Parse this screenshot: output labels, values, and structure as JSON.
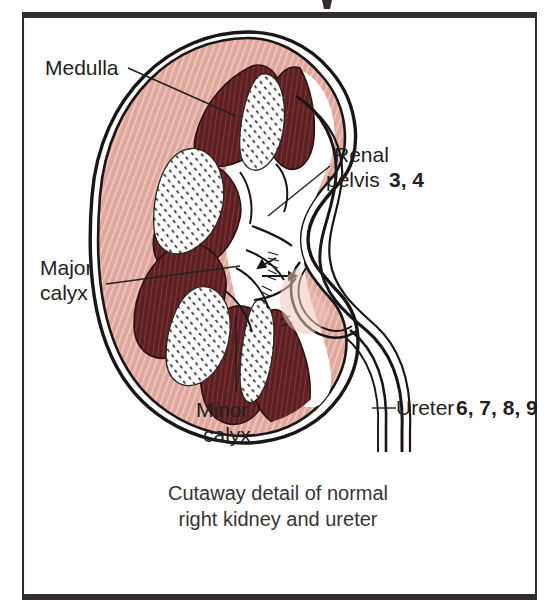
{
  "figure": {
    "title_fragment_above": "",
    "caption_line1": "Cutaway detail of normal",
    "caption_line2": "right kidney and ureter"
  },
  "labels": {
    "medulla": "Medulla",
    "major_calyx_line1": "Major",
    "major_calyx_line2": "calyx",
    "minor_calyx_line1": "Minor",
    "minor_calyx_line2": "calyx",
    "renal_pelvis_line1": "Renal",
    "renal_pelvis_line2": "pelvis",
    "renal_pelvis_refs": "3, 4",
    "ureter": "Ureter",
    "ureter_refs": "6, 7, 8, 9"
  },
  "colors": {
    "cortex_pink": "#e0a79c",
    "cortex_pink_light": "#eec3ba",
    "medulla_maroon": "#5c1f22",
    "medulla_maroon_dark": "#48171a",
    "ink": "#1a1618",
    "text": "#241f20",
    "frame": "#332b2c",
    "paper": "#ffffff"
  },
  "frame": {
    "left": 22,
    "top": 12,
    "right": 537,
    "bottom": 600,
    "thick_border_px": 6,
    "thin_border_px": 2
  },
  "anatomy": {
    "pyramids_count": 6,
    "renal_columns_count": 4,
    "ureter_tube_walls": 2
  }
}
